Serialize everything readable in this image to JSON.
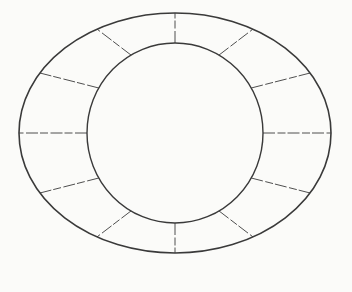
{
  "page": {
    "width": 352,
    "height": 292,
    "background_color": "#fbfbf9"
  },
  "diagram": {
    "name": "segmented-annulus-wheel",
    "center": {
      "x": 175,
      "y": 133
    },
    "outer_ellipse": {
      "rx": 156,
      "ry": 120,
      "stroke_color": "#3a3a3a",
      "stroke_width": 1.6
    },
    "inner_ellipse": {
      "rx": 88,
      "ry": 90,
      "stroke_color": "#3a3a3a",
      "stroke_width": 1.4
    },
    "spokes": {
      "count": 12,
      "angle_step_deg": 30,
      "start_angle_deg": 0,
      "stroke_color": "#4f4f4f",
      "stroke_width": 1,
      "dash_pattern": "12 2.5 8 2"
    }
  }
}
